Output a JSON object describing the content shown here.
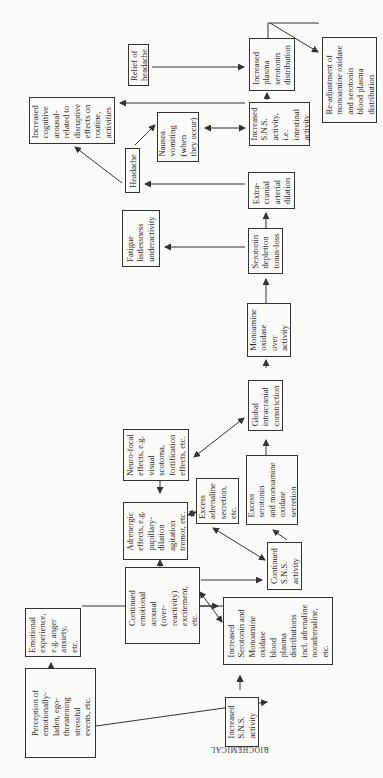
{
  "diagram": {
    "orientation": "rotated 90 degrees counter-clockwise; text reads bottom-to-top",
    "section_labels": {
      "behavioural": "BEHAVIOURAL",
      "biochemical": "BIOCHEMICAL"
    },
    "nodes": {
      "perception": "Perception of\nemotionally-\nladen, ego-\nthreatening\nstressful\nevents, etc.",
      "emotional_experience": "Emotional\nexperience,\ne.g. anger\nanxiety,\netc.",
      "continued_arousal": "Continued\nemotional\narousal\n(over-\nreactivity)\nexcitement,\netc.",
      "adrenergic": "Adrenergic\neffects, e.g.\npupillary-\ndilation\nagitation\ntremor, etc.",
      "neuro_focal": "Neuro-focal\neffects, e.g.\nvisual\nscotoma,\nfortification\neffects, etc.",
      "increased_sns": "Increased\nS.N.S.\nactivity",
      "increased_serotonin_mao": "Increased\nSerotonin and\nMonoamine\noxidase\nblood\nplasma\ndistributions\nincl. adrenaline\nnoradrenaline,\netc.",
      "continued_sns": "Continued\nS.N.S.\nactivity",
      "excess_adrenaline": "Excess\nadrenaline\nsecretion,\netc.",
      "excess_serotonin_mao": "Excess\nserotonin\nand monoamine\noxidase\nsecretion",
      "global_constriction": "Global\nintracranial\nconstriction",
      "mao_overactivity": "Monoamine\noxidase\nover\nactivity",
      "serotonin_depletion": "Serotonin\ndepletion\ntonus-loss",
      "fatigue": "Fatigue\nlistlessness\nunderactivity",
      "extracranial_dilation": "Extra-\ncranial\narterial\ndilation",
      "headache": "Headache",
      "cognitive_arousal": "Increased\ncognitive\narousal-\nrelated to\ndisruptive\neffects on\nroutine,\nactivities",
      "nausea": "Nausea\nvomiting\n(when\nthey occur)",
      "increased_sns_intestinal": "Increased\nS.N.S.\nactivity,\ni.e.\nintestinal\nactivity",
      "relief": "Relief of\nheadache",
      "increased_plasma_serotonin": "Increased\nplasma\nserotonin\ndistribution",
      "readjustment": "Re-adjustment of\nmonoamine oxidase\nand serotonin\nblood plasma\ndistribution"
    }
  }
}
